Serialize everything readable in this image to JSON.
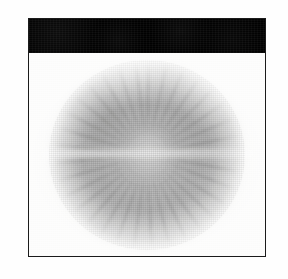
{
  "page": {
    "background_color": "#fefefe",
    "width": 288,
    "height": 279
  },
  "plate": {
    "name": "figure-plate",
    "border_color": "#1b1b1b",
    "background_color": "#fbfbfa"
  },
  "header_band": {
    "caption": "",
    "background_color": "#0d0d0d",
    "has_legible_text": false,
    "note": "solid black caption bar with scan noise; no readable characters"
  },
  "image_panel": {
    "background_color": "#fcfcfb",
    "subject": "radial grayscale specimen",
    "description": "large soft-edged circular mass with radiating spoke-like filaments, lobed darker ring and a pale horizontal band across the centre",
    "palette": {
      "lightest": "#fcfcfb",
      "mid_gray": "#a8a8a8",
      "dark_gray": "#787878",
      "frame_dark": "#1b1b1b"
    }
  }
}
